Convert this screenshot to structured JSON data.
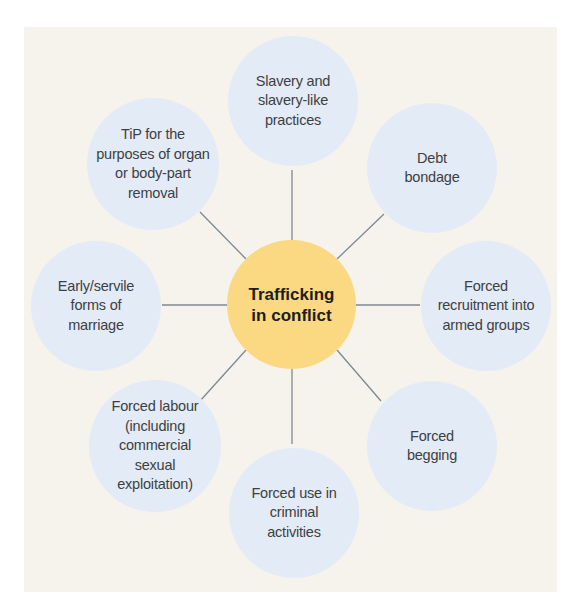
{
  "diagram": {
    "type": "hub-and-spoke",
    "colors": {
      "background": "#f5f3ec",
      "outer_circle": "#e3ebf7",
      "center_circle": "#fbd882",
      "connector": "#7d8893",
      "text": "#3d3f42"
    },
    "center": {
      "label": "Trafficking\nin conflict"
    },
    "nodes": [
      {
        "id": "slavery",
        "label": "Slavery and\nslavery-like\npractices"
      },
      {
        "id": "debt-bondage",
        "label": "Debt\nbondage"
      },
      {
        "id": "forced-recruitment",
        "label": "Forced\nrecruitment into\narmed groups"
      },
      {
        "id": "forced-begging",
        "label": "Forced\nbegging"
      },
      {
        "id": "forced-criminal",
        "label": "Forced use in\ncriminal\nactivities"
      },
      {
        "id": "forced-labour",
        "label": "Forced labour\n(including\ncommercial\nsexual\nexploitation)"
      },
      {
        "id": "early-marriage",
        "label": "Early/servile\nforms of\nmarriage"
      },
      {
        "id": "organ-removal",
        "label": "TiP for the\npurposes of organ\nor body-part\nremoval"
      }
    ]
  }
}
